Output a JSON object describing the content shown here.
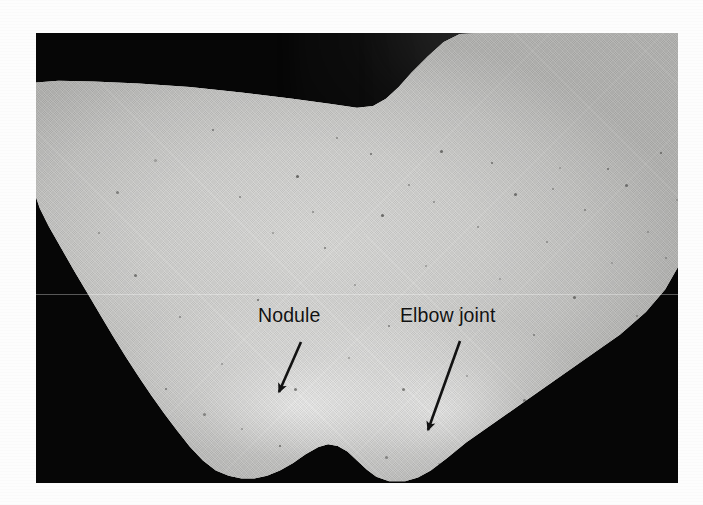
{
  "page": {
    "background_color": "#fdfdfd",
    "type": "annotated clinical photograph"
  },
  "figure": {
    "name": "elbow-photograph",
    "frame": {
      "x": 36,
      "y": 33,
      "width": 642,
      "height": 450,
      "background_color": "#060606"
    },
    "skin_color": "#cfcfcd",
    "ink_color": "#121212"
  },
  "annotations": [
    {
      "id": "nodule",
      "label": "Nodule",
      "label_x": 222,
      "label_y": 271,
      "arrow": {
        "name": "nodule-arrow",
        "from_x": 265,
        "from_y": 309,
        "to_x": 243,
        "to_y": 359,
        "stroke_width": 2.6,
        "color": "#121212"
      }
    },
    {
      "id": "elbow-joint",
      "label": "Elbow joint",
      "label_x": 364,
      "label_y": 271,
      "arrow": {
        "name": "elbow-joint-arrow",
        "from_x": 424,
        "from_y": 308,
        "to_x": 392,
        "to_y": 397,
        "stroke_width": 2.6,
        "color": "#121212"
      }
    }
  ],
  "artifacts": {
    "scanline_y": 261,
    "halftone_opacity": 0.3
  },
  "specks": [
    [
      118,
      126
    ],
    [
      176,
      96
    ],
    [
      203,
      163
    ],
    [
      236,
      199
    ],
    [
      260,
      142
    ],
    [
      288,
      214
    ],
    [
      300,
      104
    ],
    [
      318,
      251
    ],
    [
      345,
      181
    ],
    [
      352,
      292
    ],
    [
      372,
      151
    ],
    [
      389,
      232
    ],
    [
      404,
      117
    ],
    [
      423,
      276
    ],
    [
      441,
      193
    ],
    [
      463,
      245
    ],
    [
      478,
      160
    ],
    [
      497,
      301
    ],
    [
      510,
      208
    ],
    [
      523,
      134
    ],
    [
      537,
      263
    ],
    [
      548,
      176
    ],
    [
      562,
      318
    ],
    [
      575,
      229
    ],
    [
      589,
      151
    ],
    [
      600,
      282
    ],
    [
      611,
      198
    ],
    [
      624,
      119
    ],
    [
      98,
      241
    ],
    [
      143,
      283
    ],
    [
      185,
      330
    ],
    [
      221,
      266
    ],
    [
      258,
      355
    ],
    [
      276,
      178
    ],
    [
      312,
      324
    ],
    [
      334,
      120
    ],
    [
      366,
      355
    ],
    [
      397,
      168
    ],
    [
      430,
      342
    ],
    [
      455,
      129
    ],
    [
      487,
      366
    ],
    [
      516,
      155
    ],
    [
      546,
      374
    ],
    [
      571,
      135
    ],
    [
      602,
      358
    ],
    [
      629,
      224
    ],
    [
      640,
      166
    ],
    [
      652,
      290
    ],
    [
      80,
      158
    ],
    [
      62,
      199
    ],
    [
      47,
      262
    ],
    [
      129,
      355
    ],
    [
      167,
      380
    ],
    [
      205,
      395
    ],
    [
      243,
      412
    ],
    [
      295,
      418
    ],
    [
      349,
      423
    ],
    [
      402,
      430
    ],
    [
      447,
      418
    ],
    [
      481,
      400
    ],
    [
      519,
      388
    ],
    [
      558,
      360
    ],
    [
      590,
      330
    ],
    [
      617,
      300
    ]
  ]
}
